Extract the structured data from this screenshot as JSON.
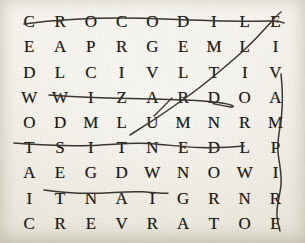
{
  "puzzle": {
    "title": "Word Search Grid",
    "rows": 9,
    "columns": 9,
    "paper_color": "#efece4",
    "ink_color": "#1d1b19",
    "pen_color": "#3a3632",
    "grid": [
      [
        "C",
        "R",
        "O",
        "C",
        "O",
        "D",
        "I",
        "L",
        "E"
      ],
      [
        "E",
        "A",
        "P",
        "R",
        "G",
        "E",
        "M",
        "L",
        "I"
      ],
      [
        "D",
        "L",
        "C",
        "I",
        "V",
        "L",
        "T",
        "I",
        "V"
      ],
      [
        "W",
        "W",
        "I",
        "Z",
        "A",
        "R",
        "D",
        "O",
        "A"
      ],
      [
        "O",
        "D",
        "M",
        "L",
        "U",
        "M",
        "N",
        "R",
        "M"
      ],
      [
        "T",
        "S",
        "I",
        "T",
        "N",
        "E",
        "D",
        "L",
        "P"
      ],
      [
        "A",
        "E",
        "G",
        "D",
        "W",
        "N",
        "O",
        "W",
        "I"
      ],
      [
        "I",
        "T",
        "N",
        "A",
        "I",
        "G",
        "R",
        "N",
        "R"
      ],
      [
        "C",
        "R",
        "E",
        "V",
        "R",
        "A",
        "T",
        "O",
        "E"
      ]
    ],
    "rows_text": [
      "C R O C O D I L E",
      "E A P R G E M L I",
      "D L C I V L T I V",
      "W W I Z A R D O A",
      "O D M L U M N R M",
      "T S I T N E D L P",
      "A E G D W N O W I",
      "I T N A I G R N R",
      "C R E V R A T O E"
    ],
    "found_words": [
      {
        "word": "CROCODILE",
        "direction": "horizontal",
        "row": 1,
        "start_column": 1,
        "end_column": 9
      },
      {
        "word": "WIZARD",
        "direction": "horizontal",
        "row": 4,
        "start_column": 2,
        "end_column": 7
      },
      {
        "word": "DENTIST",
        "direction": "horizontal-reversed",
        "row": 6,
        "start_column": 7,
        "end_column": 1
      },
      {
        "word": "GIANT",
        "direction": "horizontal-reversed",
        "row": 8,
        "start_column": 6,
        "end_column": 2
      },
      {
        "word": "VAMPIRE",
        "direction": "vertical",
        "column": 9,
        "start_row": 3,
        "end_row": 9
      },
      {
        "word": "LUMBERJACK",
        "direction": "diagonal",
        "start_row": 5,
        "start_column": 5,
        "end_row": 1,
        "end_column": 9
      }
    ]
  }
}
